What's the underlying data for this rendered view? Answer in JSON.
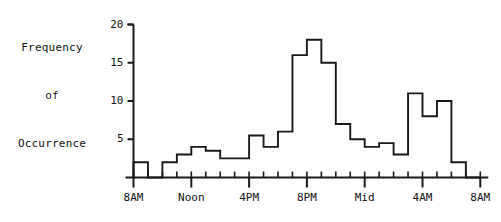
{
  "chart_data": {
    "type": "bar",
    "title": "",
    "xlabel": "",
    "ylabel": "Frequency\nof\nOccurrence",
    "ylabel_lines": [
      "Frequency",
      "of",
      "Occurrence"
    ],
    "ylim": [
      0,
      20
    ],
    "ytick_values": [
      5,
      10,
      15,
      20
    ],
    "ytick_labels": [
      "5",
      "10",
      "15",
      "20"
    ],
    "grid": false,
    "legend": null,
    "x_major_labels": [
      "8AM",
      "Noon",
      "4PM",
      "8PM",
      "Mid",
      "4AM",
      "8AM"
    ],
    "x_major_hours": [
      0,
      4,
      8,
      12,
      16,
      20,
      24
    ],
    "categories": [
      "8AM",
      "9AM",
      "10AM",
      "11AM",
      "Noon",
      "1PM",
      "2PM",
      "3PM",
      "4PM",
      "5PM",
      "6PM",
      "7PM",
      "8PM",
      "9PM",
      "10PM",
      "11PM",
      "Mid",
      "1AM",
      "2AM",
      "3AM",
      "4AM",
      "5AM",
      "6AM",
      "7AM"
    ],
    "values": [
      2,
      0,
      2,
      3,
      4,
      3.5,
      2.5,
      2.5,
      5.5,
      4,
      6,
      16,
      18,
      15,
      7,
      5,
      4,
      4.5,
      3,
      11,
      8,
      10,
      2,
      0
    ]
  },
  "style": {
    "line_color": "#1a1a1a",
    "background": "#ffffff"
  }
}
